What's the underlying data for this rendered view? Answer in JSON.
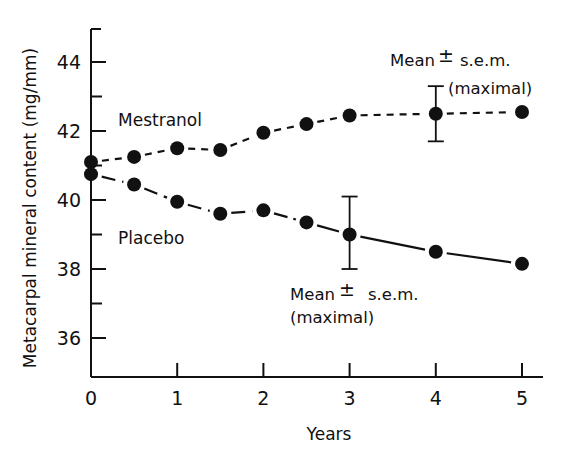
{
  "chart_data": {
    "type": "line",
    "title": "",
    "xlabel": "Years",
    "ylabel": "Metacarpal mineral content (mg/mm)",
    "xlim": [
      0,
      5.25
    ],
    "ylim": [
      35,
      45
    ],
    "x_ticks": [
      0,
      1,
      2,
      3,
      4,
      5
    ],
    "x_tick_labels": [
      "0",
      "1",
      "2",
      "3",
      "4",
      "5"
    ],
    "y_ticks": [
      36,
      37,
      38,
      39,
      40,
      41,
      42,
      43,
      44
    ],
    "y_tick_labels": [
      "36",
      "38",
      "40",
      "42",
      "44"
    ],
    "y_labeled_ticks": [
      36,
      38,
      40,
      42,
      44
    ],
    "grid": false,
    "legend": "inline labels",
    "series": [
      {
        "name": "Mestranol",
        "line_style": "dashed",
        "marker": "filled-circle",
        "x": [
          0,
          0.5,
          1,
          1.5,
          2,
          2.5,
          3,
          4,
          5
        ],
        "values": [
          41.1,
          41.25,
          41.5,
          41.45,
          41.95,
          42.2,
          42.45,
          42.5,
          42.55
        ],
        "error_bar": {
          "x": 4,
          "low": 41.7,
          "high": 43.3,
          "label": "Mean ± s.e.m. (maximal)"
        }
      },
      {
        "name": "Placebo",
        "line_style": "long-dashed / solid",
        "marker": "filled-circle",
        "x": [
          0,
          0.5,
          1,
          1.5,
          2,
          2.5,
          3,
          4,
          5
        ],
        "values": [
          40.75,
          40.45,
          39.95,
          39.6,
          39.7,
          39.35,
          39.0,
          38.5,
          38.15
        ],
        "error_bar": {
          "x": 3,
          "low": 38.0,
          "high": 40.1,
          "label": "Mean ± s.e.m. (maximal)"
        }
      }
    ],
    "annotations": [
      {
        "text": "Mean ± s.e.m.",
        "subtext": "(maximal)",
        "near": "Mestranol error bar at year 4"
      },
      {
        "text": "Mean ± s.e.m.",
        "subtext": "(maximal)",
        "near": "Placebo error bar at year 3"
      }
    ]
  },
  "labels": {
    "xlabel": "Years",
    "ylabel": "Metacarpal mineral content (mg/mm)",
    "mestranol": "Mestranol",
    "placebo": "Placebo",
    "ann_top_line1": "Mean",
    "ann_top_pm": "±",
    "ann_top_sem": "s.e.m.",
    "ann_top_line2": "(maximal)",
    "ann_bot_line1": "Mean",
    "ann_bot_pm": "±",
    "ann_bot_sem": "s.e.m.",
    "ann_bot_line2": "(maximal)"
  },
  "colors": {
    "ink": "#111111",
    "background": "#ffffff"
  }
}
